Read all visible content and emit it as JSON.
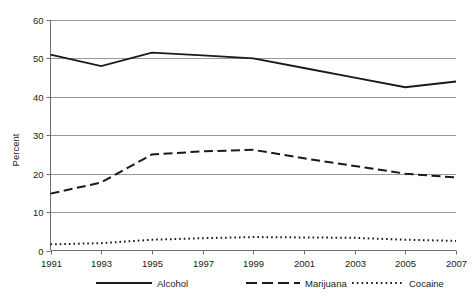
{
  "chart_data": {
    "type": "line",
    "title": "",
    "xlabel": "",
    "ylabel": "Percent",
    "x": [
      1991,
      1993,
      1995,
      1997,
      1999,
      2001,
      2003,
      2005,
      2007
    ],
    "categories": [
      "1991",
      "1993",
      "1995",
      "1997",
      "1999",
      "2001",
      "2003",
      "2005",
      "2007"
    ],
    "xlim": [
      1991,
      2007
    ],
    "ylim": [
      0,
      60
    ],
    "yticks": [
      0,
      10,
      20,
      30,
      40,
      50,
      60
    ],
    "ytick_labels": [
      "0",
      "10",
      "20",
      "30",
      "40",
      "50",
      "60"
    ],
    "grid": "horizontal",
    "legend_position": "bottom",
    "series": [
      {
        "name": "Alcohol",
        "style": "solid",
        "color": "#1a1a1a",
        "values": [
          51.0,
          48.0,
          51.5,
          50.8,
          50.0,
          47.5,
          45.0,
          42.5,
          44.0
        ]
      },
      {
        "name": "Marijuana",
        "style": "dashed",
        "color": "#1a1a1a",
        "values": [
          14.8,
          17.7,
          25.0,
          25.8,
          26.2,
          24.0,
          22.0,
          20.0,
          19.0
        ]
      },
      {
        "name": "Cocaine",
        "style": "dotted",
        "color": "#1a1a1a",
        "values": [
          1.6,
          1.9,
          2.8,
          3.2,
          3.5,
          3.4,
          3.3,
          2.8,
          2.5
        ]
      }
    ]
  },
  "axis": {
    "y_title": "Percent",
    "y_tick_0": "0",
    "y_tick_1": "10",
    "y_tick_2": "20",
    "y_tick_3": "30",
    "y_tick_4": "40",
    "y_tick_5": "50",
    "y_tick_6": "60",
    "x_tick_0": "1991",
    "x_tick_1": "1993",
    "x_tick_2": "1995",
    "x_tick_3": "1997",
    "x_tick_4": "1999",
    "x_tick_5": "2001",
    "x_tick_6": "2003",
    "x_tick_7": "2005",
    "x_tick_8": "2007"
  },
  "legend": {
    "items": [
      {
        "label": "Alcohol",
        "style": "solid"
      },
      {
        "label": "Marijuana",
        "style": "dashed"
      },
      {
        "label": "Cocaine",
        "style": "dotted"
      }
    ]
  },
  "colors": {
    "ink": "#1a1a1a",
    "grid": "#8c8c8c",
    "axis": "#6e6e6e",
    "background": "#ffffff"
  }
}
